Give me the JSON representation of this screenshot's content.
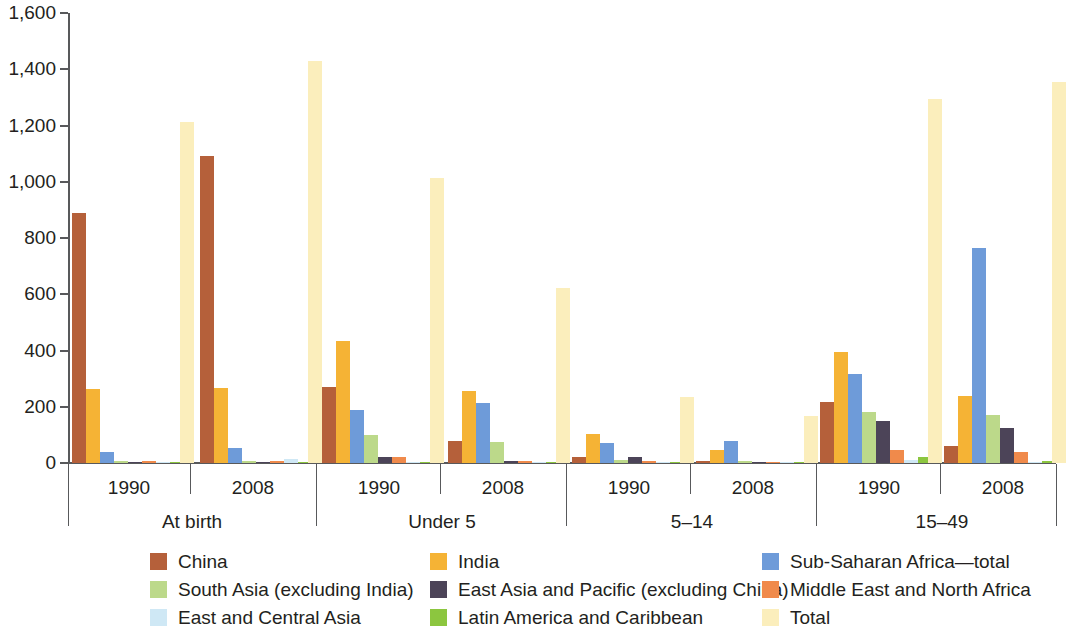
{
  "chart_data": {
    "type": "bar",
    "title": "",
    "subtitle": "",
    "xlabel": "",
    "ylabel": "",
    "ylim": [
      0,
      1600
    ],
    "yticks": [
      0,
      200,
      400,
      600,
      800,
      1000,
      1200,
      1400,
      1600
    ],
    "ytick_labels": [
      "0",
      "200",
      "400",
      "600",
      "800",
      "1,000",
      "1,200",
      "1,400",
      "1,600"
    ],
    "grid": false,
    "legend_position": "bottom",
    "group_labels": [
      "At birth",
      "Under 5",
      "5–14",
      "15–49"
    ],
    "categories": [
      "At birth 1990",
      "At birth 2008",
      "Under 5 1990",
      "Under 5 2008",
      "5–14 1990",
      "5–14 2008",
      "15–49 1990",
      "15–49 2008"
    ],
    "year_labels": [
      "1990",
      "2008",
      "1990",
      "2008",
      "1990",
      "2008",
      "1990",
      "2008"
    ],
    "series": [
      {
        "name": "China",
        "color": "#b5603a",
        "values": [
          888,
          1092,
          270,
          78,
          20,
          8,
          218,
          60
        ]
      },
      {
        "name": "India",
        "color": "#f5b335",
        "values": [
          263,
          265,
          435,
          256,
          103,
          46,
          396,
          240
        ]
      },
      {
        "name": "Sub-Saharan Africa—total",
        "color": "#6e9bd9",
        "values": [
          40,
          52,
          190,
          215,
          70,
          80,
          316,
          765
        ]
      },
      {
        "name": "South Asia (excluding India)",
        "color": "#bcd98a",
        "values": [
          6,
          7,
          100,
          74,
          12,
          6,
          180,
          170
        ]
      },
      {
        "name": "East Asia and Pacific (excluding China)",
        "color": "#4c4458",
        "values": [
          4,
          5,
          20,
          6,
          22,
          5,
          148,
          126
        ]
      },
      {
        "name": "Middle East and North Africa",
        "color": "#f08a4b",
        "values": [
          7,
          8,
          22,
          7,
          6,
          4,
          46,
          38
        ]
      },
      {
        "name": "East and Central Asia",
        "color": "#cfe8f5",
        "values": [
          5,
          14,
          4,
          4,
          3,
          3,
          12,
          5
        ]
      },
      {
        "name": "Latin America and Caribbean",
        "color": "#8cc63f",
        "values": [
          3,
          4,
          4,
          3,
          3,
          3,
          22,
          8
        ]
      },
      {
        "name": "Total",
        "color": "#fbeebc",
        "values": [
          1212,
          1428,
          1012,
          624,
          236,
          168,
          1293,
          1353
        ]
      }
    ]
  },
  "legend": {
    "items": [
      {
        "label": "China",
        "color": "#b5603a"
      },
      {
        "label": "India",
        "color": "#f5b335"
      },
      {
        "label": "Sub-Saharan Africa—total",
        "color": "#6e9bd9"
      },
      {
        "label": "South Asia (excluding India)",
        "color": "#bcd98a"
      },
      {
        "label": "East Asia and Pacific (excluding China)",
        "color": "#4c4458"
      },
      {
        "label": "Middle East and North Africa",
        "color": "#f08a4b"
      },
      {
        "label": "East and Central Asia",
        "color": "#cfe8f5"
      },
      {
        "label": "Latin America and Caribbean",
        "color": "#8cc63f"
      },
      {
        "label": "Total",
        "color": "#fbeebc"
      }
    ]
  }
}
